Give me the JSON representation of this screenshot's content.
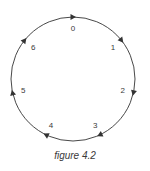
{
  "figure": {
    "caption": "figure 4.2",
    "type": "circular-cycle",
    "direction": "clockwise",
    "stroke_color": "#333333",
    "circle": {
      "cx": 73,
      "cy": 79,
      "r": 62
    },
    "nodes": [
      {
        "label": "0",
        "angle_deg": 0
      },
      {
        "label": "1",
        "angle_deg": 51.43
      },
      {
        "label": "2",
        "angle_deg": 102.86
      },
      {
        "label": "3",
        "angle_deg": 154.29
      },
      {
        "label": "4",
        "angle_deg": 205.71
      },
      {
        "label": "5",
        "angle_deg": 257.14
      },
      {
        "label": "6",
        "angle_deg": 308.57
      }
    ]
  }
}
